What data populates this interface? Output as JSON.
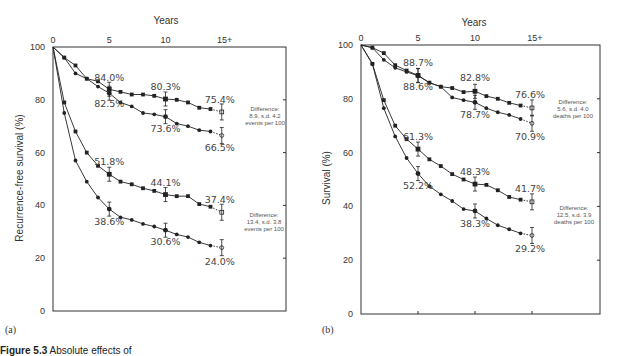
{
  "chart_data": [
    {
      "type": "line",
      "panel_label": "(a)",
      "title": "",
      "x_axis_title": "Years",
      "x_ticks": [
        "0",
        "5",
        "10",
        "15+"
      ],
      "ylabel": "Recurrence-free survival (%)",
      "y_ticks": [
        "0",
        "20",
        "40",
        "60",
        "80",
        "100"
      ],
      "ylim": [
        0,
        100
      ],
      "grid": false,
      "series": [
        {
          "name": "upper-A-squares",
          "marker": "square",
          "x": [
            0,
            1,
            2,
            3,
            4,
            5,
            6,
            7,
            8,
            9,
            10,
            11,
            12,
            13,
            14,
            15
          ],
          "values": [
            100,
            96,
            93,
            88,
            87,
            84.0,
            83,
            82,
            82,
            81.5,
            80.3,
            80,
            79,
            77,
            76.5,
            75.4
          ]
        },
        {
          "name": "upper-A-circles",
          "marker": "circle",
          "x": [
            0,
            1,
            2,
            3,
            4,
            5,
            6,
            7,
            8,
            9,
            10,
            11,
            12,
            13,
            14,
            15
          ],
          "values": [
            100,
            96,
            90,
            88,
            85,
            82.5,
            79,
            77.5,
            75,
            74.5,
            73.6,
            71,
            70,
            68.5,
            68,
            66.5
          ]
        },
        {
          "name": "lower-A-squares",
          "marker": "square",
          "x": [
            0,
            1,
            2,
            3,
            4,
            5,
            6,
            7,
            8,
            9,
            10,
            11,
            12,
            13,
            14,
            15
          ],
          "values": [
            100,
            79,
            68,
            60,
            55,
            51.8,
            49,
            48,
            46.5,
            45.5,
            44.1,
            43.5,
            43.5,
            40.5,
            39.5,
            37.4
          ]
        },
        {
          "name": "lower-A-circles",
          "marker": "circle",
          "x": [
            0,
            1,
            2,
            3,
            4,
            5,
            6,
            7,
            8,
            9,
            10,
            11,
            12,
            13,
            14,
            15
          ],
          "values": [
            100,
            75,
            57,
            49,
            43,
            38.6,
            35.5,
            34.5,
            33,
            32,
            30.6,
            29,
            28,
            26,
            24.8,
            24.0
          ]
        }
      ],
      "point_labels": [
        {
          "text": "84.0%",
          "x": 5,
          "y": 84.0
        },
        {
          "text": "82.5%",
          "x": 5,
          "y": 82.5
        },
        {
          "text": "80.3%",
          "x": 10,
          "y": 80.3
        },
        {
          "text": "73.6%",
          "x": 10,
          "y": 73.6
        },
        {
          "text": "75.4%",
          "x": 15,
          "y": 75.4
        },
        {
          "text": "66.5%",
          "x": 15,
          "y": 66.5
        },
        {
          "text": "51.8%",
          "x": 5,
          "y": 51.8
        },
        {
          "text": "38.6%",
          "x": 5,
          "y": 38.6
        },
        {
          "text": "44.1%",
          "x": 10,
          "y": 44.1
        },
        {
          "text": "30.6%",
          "x": 10,
          "y": 30.6
        },
        {
          "text": "37.4%",
          "x": 15,
          "y": 37.4
        },
        {
          "text": "24.0%",
          "x": 15,
          "y": 24.0
        }
      ],
      "annotations": [
        {
          "lines": [
            "Difference:",
            "8.9, s.d.  4.2",
            "events per 100"
          ]
        },
        {
          "lines": [
            "Difference:",
            "13.4, s.d. 3.8",
            "events per 100"
          ]
        }
      ]
    },
    {
      "type": "line",
      "panel_label": "(b)",
      "title": "",
      "x_axis_title": "Years",
      "x_ticks": [
        "0",
        "5",
        "10",
        "15+"
      ],
      "ylabel": "Survival (%)",
      "y_ticks": [
        "0",
        "20",
        "40",
        "60",
        "80",
        "100"
      ],
      "ylim": [
        0,
        100
      ],
      "grid": false,
      "series": [
        {
          "name": "upper-B-squares",
          "marker": "square",
          "x": [
            0,
            1,
            2,
            3,
            4,
            5,
            6,
            7,
            8,
            9,
            10,
            11,
            12,
            13,
            14,
            15
          ],
          "values": [
            100,
            99,
            97,
            92.5,
            90.5,
            88.7,
            86,
            84.5,
            84,
            82.5,
            82.8,
            81,
            80,
            78.5,
            77.5,
            76.6
          ]
        },
        {
          "name": "upper-B-circles",
          "marker": "circle",
          "x": [
            0,
            1,
            2,
            3,
            4,
            5,
            6,
            7,
            8,
            9,
            10,
            11,
            12,
            13,
            14,
            15
          ],
          "values": [
            100,
            99,
            94.5,
            91.5,
            90,
            88.6,
            86,
            84.5,
            80.5,
            79.5,
            78.7,
            76.5,
            75,
            74,
            72.5,
            70.9
          ]
        },
        {
          "name": "lower-B-squares",
          "marker": "square",
          "x": [
            0,
            1,
            2,
            3,
            4,
            5,
            6,
            7,
            8,
            9,
            10,
            11,
            12,
            13,
            14,
            15
          ],
          "values": [
            100,
            93,
            79.5,
            70,
            65,
            61.3,
            57.5,
            55,
            52,
            50,
            48.3,
            48,
            46,
            43.5,
            42.5,
            41.7
          ]
        },
        {
          "name": "lower-B-circles",
          "marker": "circle",
          "x": [
            0,
            1,
            2,
            3,
            4,
            5,
            6,
            7,
            8,
            9,
            10,
            11,
            12,
            13,
            14,
            15
          ],
          "values": [
            100,
            93,
            76.5,
            66,
            58,
            52.2,
            47.5,
            44.5,
            42,
            39,
            38.3,
            35.5,
            33,
            31.5,
            30,
            29.2
          ]
        }
      ],
      "point_labels": [
        {
          "text": "88.7%",
          "x": 5,
          "y": 88.7
        },
        {
          "text": "88.6%",
          "x": 5,
          "y": 88.6
        },
        {
          "text": "82.8%",
          "x": 10,
          "y": 82.8
        },
        {
          "text": "78.7%",
          "x": 10,
          "y": 78.7
        },
        {
          "text": "76.6%",
          "x": 15,
          "y": 76.6
        },
        {
          "text": "70.9%",
          "x": 15,
          "y": 70.9
        },
        {
          "text": "61.3%",
          "x": 5,
          "y": 61.3
        },
        {
          "text": "52.2%",
          "x": 5,
          "y": 52.2
        },
        {
          "text": "48.3%",
          "x": 10,
          "y": 48.3
        },
        {
          "text": "38.3%",
          "x": 10,
          "y": 38.3
        },
        {
          "text": "41.7%",
          "x": 15,
          "y": 41.7
        },
        {
          "text": "29.2%",
          "x": 15,
          "y": 29.2
        }
      ],
      "annotations": [
        {
          "lines": [
            "Difference:",
            "5.6, s.d. 4.0",
            "deaths per 100"
          ]
        },
        {
          "lines": [
            "Difference:",
            "12.5, s.d. 3.9",
            "deaths per 100"
          ]
        }
      ]
    }
  ],
  "caption": {
    "label": "Figure 5.3",
    "text": "Absolute effects of"
  },
  "colors": {
    "line": "#222222",
    "text": "#444444",
    "axis": "#333333"
  }
}
